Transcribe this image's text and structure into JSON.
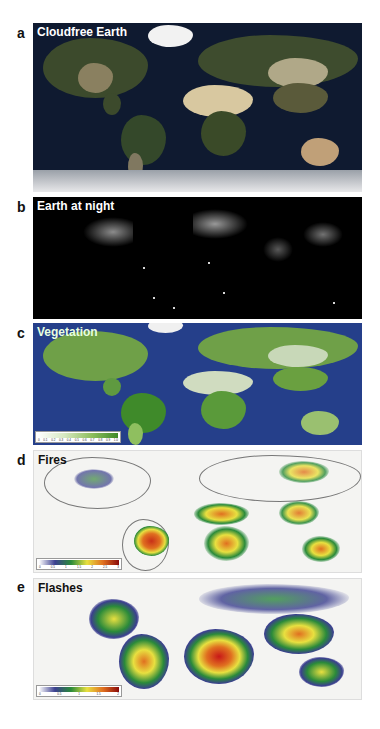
{
  "panels": [
    {
      "letter": "a",
      "title": "Cloudfree Earth",
      "background": "#0f1a30",
      "title_color": "#ffffff"
    },
    {
      "letter": "b",
      "title": "Earth at night",
      "background": "#000000",
      "title_color": "#ffffff"
    },
    {
      "letter": "c",
      "title": "Vegetation",
      "background": "#253f8a",
      "title_color": "#e8ffe0",
      "colorbar": {
        "colors": [
          "#ffffff",
          "#d6e8c0",
          "#8fbf5f",
          "#3f8a2a"
        ],
        "ticks": [
          "0",
          "0.1",
          "0.2",
          "0.3",
          "0.4",
          "0.5",
          "0.6",
          "0.7",
          "0.8",
          "0.9",
          "1.0"
        ]
      }
    },
    {
      "letter": "d",
      "title": "Fires",
      "background": "#f4f4f2",
      "title_color": "#111111",
      "colorbar": {
        "colors": [
          "#ffffff",
          "#3b3f8f",
          "#2a8a3a",
          "#e8e040",
          "#e07020",
          "#8a0a0a"
        ],
        "ticks": [
          "0",
          "0.5",
          "1",
          "1.5",
          "2",
          "2.5",
          "3"
        ]
      }
    },
    {
      "letter": "e",
      "title": "Flashes",
      "background": "#f4f4f2",
      "title_color": "#111111",
      "colorbar": {
        "colors": [
          "#ffffff",
          "#3b3f8f",
          "#2a8a3a",
          "#e8e040",
          "#e07020",
          "#8a0a0a"
        ],
        "ticks": [
          "0",
          "0.5",
          "1",
          "1.5",
          "2"
        ]
      }
    }
  ]
}
